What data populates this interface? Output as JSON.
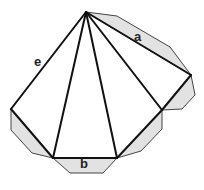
{
  "diagram": {
    "colors": {
      "stroke": "#111111",
      "flap_fill": "#e2e2e2",
      "flap_stroke": "#444444",
      "background": "#ffffff"
    },
    "labels": {
      "a": "a",
      "b": "b",
      "e": "e"
    },
    "apex": [
      86,
      12
    ],
    "base_vertices": [
      [
        11,
        109
      ],
      [
        53,
        158
      ],
      [
        117,
        158
      ],
      [
        162,
        110
      ],
      [
        191,
        75
      ]
    ]
  }
}
